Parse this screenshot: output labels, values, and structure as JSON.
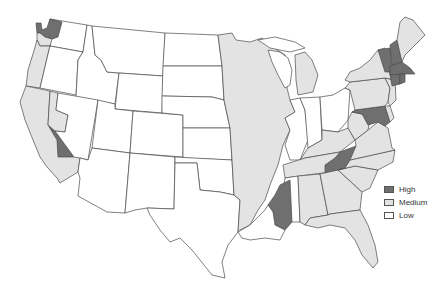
{
  "map": {
    "type": "choropleth",
    "region": "Contiguous United States",
    "colors": {
      "high": "#6f6f6f",
      "medium": "#e3e3e3",
      "low": "#ffffff",
      "border": "#4a4a4a"
    }
  },
  "legend": {
    "items": [
      {
        "key": "high",
        "label": "High",
        "color": "#6f6f6f"
      },
      {
        "key": "medium",
        "label": "Medium",
        "color": "#e3e3e3"
      },
      {
        "key": "low",
        "label": "Low",
        "color": "#ffffff"
      }
    ]
  },
  "regions": {
    "high": [
      "Northwest Washington (Puget Sound)",
      "East-central California strip",
      "Eastern Tennessee (Appalachian)",
      "Western Mississippi (Delta)",
      "Vermont",
      "New Hampshire",
      "Massachusetts",
      "Connecticut",
      "Rhode Island",
      "Maryland"
    ],
    "medium": [
      "Western Washington coast",
      "Western Oregon",
      "California",
      "Western Nevada",
      "Upper Mississippi River corridor (MN, WI, IA, IL, MO, AR, LA)",
      "Michigan (parts)",
      "New York",
      "Pennsylvania",
      "New Jersey",
      "Maine",
      "Virginia",
      "West Virginia",
      "Kentucky",
      "North Carolina",
      "South Carolina",
      "Georgia",
      "Alabama",
      "Florida",
      "Ohio (parts)"
    ],
    "low": [
      "Idaho",
      "Montana",
      "Wyoming",
      "Utah",
      "Arizona",
      "New Mexico",
      "Colorado",
      "North Dakota",
      "South Dakota",
      "Nebraska",
      "Kansas",
      "Oklahoma",
      "Texas",
      "Eastern Nevada",
      "Eastern Oregon",
      "Eastern Washington",
      "Indiana",
      "Louisiana (south)"
    ]
  }
}
